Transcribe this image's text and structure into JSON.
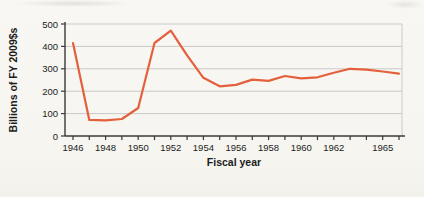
{
  "figure": {
    "background_color": "#f7f6f1"
  },
  "chart_data": {
    "type": "line",
    "title": "",
    "xlabel": "Fiscal year",
    "ylabel": "Billions of FY 2009$s",
    "x": [
      1946,
      1947,
      1948,
      1949,
      1950,
      1951,
      1952,
      1953,
      1954,
      1955,
      1956,
      1957,
      1958,
      1959,
      1960,
      1961,
      1962,
      1963,
      1964,
      1965,
      1966
    ],
    "values": [
      415,
      72,
      70,
      76,
      125,
      415,
      470,
      360,
      260,
      222,
      228,
      252,
      246,
      268,
      257,
      262,
      282,
      300,
      296,
      288,
      278
    ],
    "ylim": [
      0,
      500
    ],
    "yticks": [
      0,
      100,
      200,
      300,
      400,
      500
    ],
    "xtick_label_years": [
      1946,
      1948,
      1950,
      1952,
      1954,
      1956,
      1958,
      1960,
      1962,
      1965
    ],
    "xtick_labels": [
      "1946",
      "1948",
      "1950",
      "1952",
      "1954",
      "1956",
      "1958",
      "1960",
      "1962",
      "1965"
    ],
    "grid": true,
    "legend": "none",
    "line_color": "#e4603c",
    "grid_color": "#c9c9c9",
    "axis_color": "#3a3a3a"
  }
}
